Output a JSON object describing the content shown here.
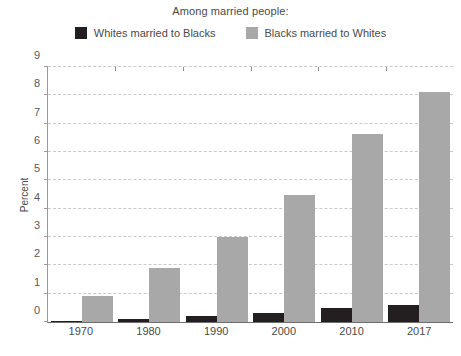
{
  "chart_data": {
    "type": "bar",
    "title": "Among married people:",
    "xlabel": "",
    "ylabel": "Percent",
    "categories": [
      "1970",
      "1980",
      "1990",
      "2000",
      "2010",
      "2017"
    ],
    "ylim": [
      0,
      9
    ],
    "yticks": [
      "0",
      "1",
      "2",
      "3",
      "4",
      "5",
      "6",
      "7",
      "8",
      "9"
    ],
    "grid": true,
    "legend_position": "top",
    "series": [
      {
        "name": "Whites married to Blacks",
        "color": "#231f20",
        "values": [
          0.05,
          0.1,
          0.2,
          0.3,
          0.5,
          0.6
        ]
      },
      {
        "name": "Blacks married to Whites",
        "color": "#a8a8a8",
        "values": [
          0.9,
          1.9,
          3.0,
          4.45,
          6.6,
          8.1
        ]
      }
    ]
  }
}
